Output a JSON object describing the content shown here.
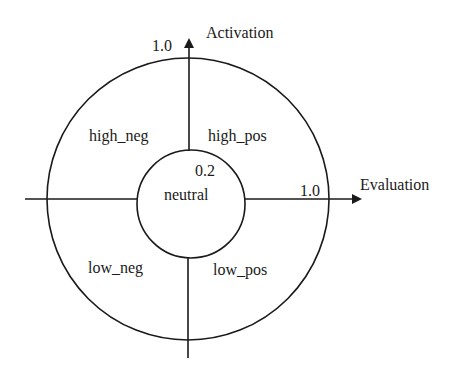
{
  "diagram": {
    "axes": {
      "vertical": {
        "label": "Activation",
        "max_label": "1.0"
      },
      "horizontal": {
        "label": "Evaluation",
        "max_label": "1.0"
      }
    },
    "inner_circle": {
      "radius_label": "0.2",
      "region_label": "neutral"
    },
    "quadrants": {
      "top_left": "high_neg",
      "top_right": "high_pos",
      "bottom_left": "low_neg",
      "bottom_right": "low_pos"
    },
    "colors": {
      "stroke": "#1a1a1a",
      "background": "#ffffff"
    }
  }
}
